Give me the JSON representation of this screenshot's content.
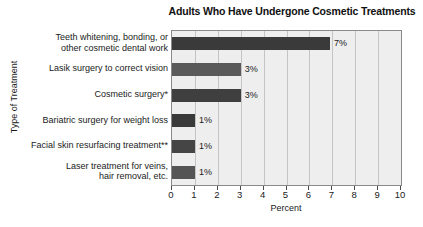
{
  "chart_data": {
    "type": "bar",
    "orientation": "horizontal",
    "title": "Adults Who Have Undergone Cosmetic Treatments",
    "xlabel": "Percent",
    "ylabel": "Type of Treatment",
    "xlim": [
      0,
      10
    ],
    "xticks": [
      0,
      1,
      2,
      3,
      4,
      5,
      6,
      7,
      8,
      9,
      10
    ],
    "xtick_labels": [
      "0",
      "1",
      "2",
      "3",
      "4",
      "5",
      "6",
      "7",
      "8",
      "9",
      "10"
    ],
    "grid": true,
    "grid_axis": "x",
    "legend": false,
    "plot_background": "#eeeeee",
    "categories": [
      "Teeth whitening, bonding, or\nother cosmetic dental work",
      "Lasik surgery to correct vision",
      "Cosmetic surgery*",
      "Bariatric surgery for weight loss",
      "Facial skin resurfacing treatment**",
      "Laser treatment for veins,\nhair removal, etc."
    ],
    "values": [
      6.9,
      3.0,
      3.0,
      1.0,
      1.0,
      1.0
    ],
    "data_labels": [
      "7%",
      "3%",
      "3%",
      "1%",
      "1%",
      "1%"
    ],
    "bar_colors": [
      "#3a3a3a",
      "#5a5a5a",
      "#3f3f3f",
      "#3a3a3a",
      "#454545",
      "#555555"
    ]
  }
}
